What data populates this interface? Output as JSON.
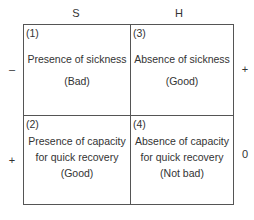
{
  "columns": [
    {
      "label": "S"
    },
    {
      "label": "H"
    }
  ],
  "rows": [
    {
      "left_sign": "–",
      "right_sign": "+"
    },
    {
      "left_sign": "+",
      "right_sign": "0"
    }
  ],
  "cells": [
    {
      "number": "(1)",
      "lines": [
        "Presence of sickness"
      ],
      "evaluation": "(Bad)"
    },
    {
      "number": "(3)",
      "lines": [
        "Absence of sickness"
      ],
      "evaluation": "(Good)"
    },
    {
      "number": "(2)",
      "lines": [
        "Presence of capacity",
        "for quick recovery"
      ],
      "evaluation": "(Good)"
    },
    {
      "number": "(4)",
      "lines": [
        "Absence of capacity",
        "for quick recovery"
      ],
      "evaluation": "(Not bad)"
    }
  ],
  "colors": {
    "line": "#555555",
    "text": "#333333",
    "background": "#ffffff"
  }
}
